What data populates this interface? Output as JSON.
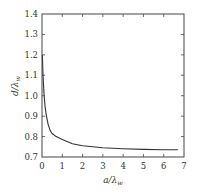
{
  "chart_data": {
    "type": "line",
    "title": "",
    "xlabel": "a/λw",
    "xlabel_main": "a/λ",
    "xlabel_sub": "w",
    "ylabel": "d/λw",
    "ylabel_main": "d/λ",
    "ylabel_sub": "w",
    "xlim": [
      0,
      7
    ],
    "ylim": [
      0.7,
      1.4
    ],
    "xticks": [
      0,
      1,
      2,
      3,
      4,
      5,
      6,
      7
    ],
    "yticks": [
      0.7,
      0.8,
      0.9,
      1.0,
      1.1,
      1.2,
      1.3,
      1.4
    ],
    "xtick_labels": [
      "0",
      "1",
      "2",
      "3",
      "4",
      "5",
      "6",
      "7"
    ],
    "ytick_labels": [
      "0.7",
      "0.8",
      "0.9",
      "1.0",
      "1.1",
      "1.2",
      "1.3",
      "1.4"
    ],
    "grid": false,
    "legend": null,
    "series": [
      {
        "name": "d/λw",
        "color": "#333333",
        "x": [
          0.02,
          0.05,
          0.1,
          0.15,
          0.2,
          0.3,
          0.4,
          0.5,
          0.7,
          1.0,
          1.5,
          2.0,
          2.5,
          3.0,
          4.0,
          5.0,
          6.0,
          6.7
        ],
        "y": [
          1.2,
          1.1,
          1.01,
          0.95,
          0.91,
          0.86,
          0.83,
          0.815,
          0.8,
          0.785,
          0.765,
          0.755,
          0.75,
          0.745,
          0.74,
          0.737,
          0.735,
          0.735
        ]
      }
    ]
  }
}
